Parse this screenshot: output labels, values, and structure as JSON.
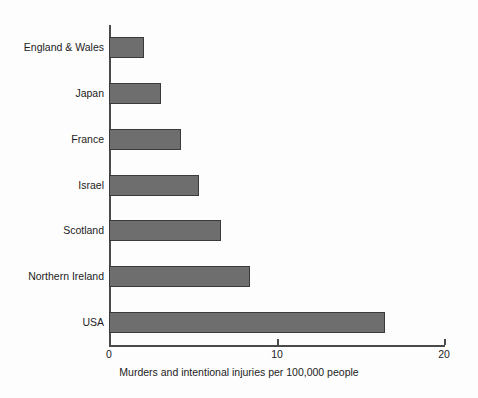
{
  "chart_data": {
    "type": "bar",
    "orientation": "horizontal",
    "title": "",
    "subtitle": "",
    "xlabel": "Murders and intentional injuries per 100,000 people",
    "ylabel": "",
    "categories": [
      "England & Wales",
      "Japan",
      "France",
      "Israel",
      "Scotland",
      "Northern Ireland",
      "USA"
    ],
    "values": [
      2.1,
      3.1,
      4.3,
      5.4,
      6.7,
      8.4,
      16.5
    ],
    "xlim": [
      0,
      20
    ],
    "xticks": [
      0,
      10,
      20
    ],
    "xtick_labels": [
      "0",
      "10",
      "20"
    ],
    "grid": false,
    "legend": false,
    "legend_position": "none",
    "bar_fill_color": "#6e6e6e",
    "bar_edge_color": "#3a3a3a",
    "axis_color": "#4a4a4a",
    "background_color": "#fdfdfd",
    "text_color": "#1c1c1c"
  }
}
